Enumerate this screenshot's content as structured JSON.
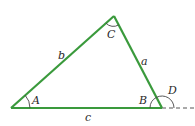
{
  "diagram": {
    "type": "triangle",
    "stroke_color": "#3a9a3c",
    "arc_color": "#444444",
    "vertices": {
      "A": {
        "x": 11,
        "y": 108
      },
      "B": {
        "x": 162,
        "y": 108
      },
      "C": {
        "x": 114,
        "y": 16
      }
    },
    "sides": {
      "a": {
        "label": "a",
        "between": "B-C"
      },
      "b": {
        "label": "b",
        "between": "A-C"
      },
      "c": {
        "label": "c",
        "between": "A-B"
      }
    },
    "angles": {
      "A": {
        "label": "A"
      },
      "B": {
        "label": "B"
      },
      "C": {
        "label": "C"
      },
      "D": {
        "label": "D",
        "note": "exterior angle at B"
      }
    },
    "extension": {
      "style": "dashed",
      "from": "B",
      "to_x": 195
    }
  }
}
